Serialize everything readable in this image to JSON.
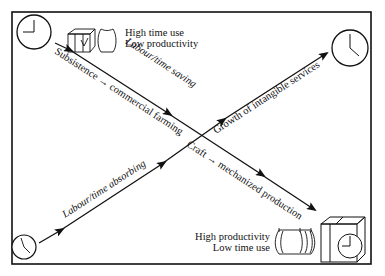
{
  "diagram": {
    "top_left_label": {
      "line1": "High time use",
      "line2": "Low productivity"
    },
    "bottom_right_label": {
      "line1": "High productivity",
      "line2": "Low time use"
    },
    "arrows": {
      "descending": {
        "above": "Labour/time saving",
        "below_upper": "Subsistence → commercial farming",
        "below_lower": "Craft → mechanized production"
      },
      "ascending": {
        "above_upper": "Growth of intangible services",
        "above_lower": "Labour/time absorbing"
      }
    },
    "icons": [
      "clock-icon-top-left",
      "clock-icon-top-right",
      "clock-icon-bottom-left",
      "bundle-icon",
      "sack-icon",
      "machine-with-clock-icon",
      "tied-sacks-icon"
    ],
    "colors": {
      "line": "#111111",
      "background": "#ffffff"
    }
  }
}
